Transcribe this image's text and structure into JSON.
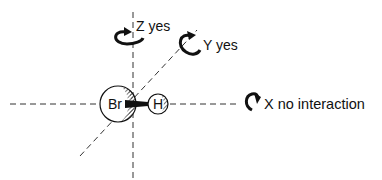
{
  "diagram": {
    "type": "molecular-rotation-axes",
    "molecule": {
      "atoms": [
        {
          "symbol": "Br",
          "role": "large-atom"
        },
        {
          "symbol": "H",
          "role": "small-atom"
        }
      ],
      "bond": "Br-H"
    },
    "axes": [
      {
        "name": "Z",
        "result": "yes",
        "label": "Z yes"
      },
      {
        "name": "Y",
        "result": "yes",
        "label": "Y yes"
      },
      {
        "name": "X",
        "result": "no interaction",
        "label": "X no interaction"
      }
    ],
    "colors": {
      "ink": "#111111",
      "background": "#ffffff"
    }
  }
}
